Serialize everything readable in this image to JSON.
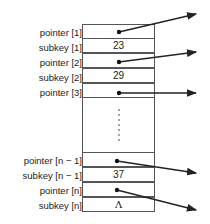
{
  "rows_top": [
    {
      "label": "pointer [1]",
      "value": "",
      "kind": "pointer"
    },
    {
      "label": "subkey [1]",
      "value": "23",
      "kind": "subkey"
    },
    {
      "label": "pointer [2]",
      "value": "",
      "kind": "pointer"
    },
    {
      "label": "subkey [2]",
      "value": "29",
      "kind": "subkey"
    },
    {
      "label": "pointer [3]",
      "value": "",
      "kind": "pointer"
    }
  ],
  "rows_bottom": [
    {
      "label": "pointer [n − 1]",
      "value": "",
      "kind": "pointer"
    },
    {
      "label": "subkey [n − 1]",
      "value": "37",
      "kind": "subkey"
    },
    {
      "label": "pointer [n]",
      "value": "",
      "kind": "pointer"
    },
    {
      "label": "subkey [n]",
      "value": "Λ",
      "kind": "subkey"
    }
  ],
  "ellipsis": "⋮"
}
